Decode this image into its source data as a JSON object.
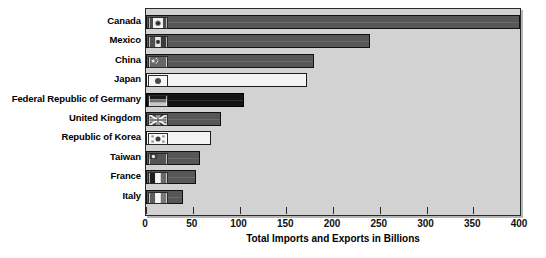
{
  "chart_data": {
    "type": "bar",
    "orientation": "horizontal",
    "title": "",
    "xlabel": "Total Imports and Exports in Billions",
    "ylabel": "",
    "xlim": [
      0,
      400
    ],
    "xticks": [
      0,
      50,
      100,
      150,
      200,
      250,
      300,
      350,
      400
    ],
    "grid": false,
    "legend": "none",
    "categories": [
      "Canada",
      "Mexico",
      "China",
      "Japan",
      "Federal Republic of Germany",
      "United Kingdom",
      "Republic of Korea",
      "Taiwan",
      "France",
      "Italy"
    ],
    "values": [
      400,
      240,
      180,
      172,
      105,
      80,
      70,
      58,
      53,
      40
    ],
    "bars": [
      {
        "label": "Canada",
        "value": 400,
        "style": "dark-gray",
        "flag": "flag-canada-icon"
      },
      {
        "label": "Mexico",
        "value": 240,
        "style": "dark-gray",
        "flag": "flag-mexico-icon"
      },
      {
        "label": "China",
        "value": 180,
        "style": "dark-gray",
        "flag": "flag-china-icon"
      },
      {
        "label": "Japan",
        "value": 172,
        "style": "light",
        "flag": "flag-japan-icon"
      },
      {
        "label": "Federal Republic of Germany",
        "value": 105,
        "style": "black",
        "flag": "flag-germany-icon"
      },
      {
        "label": "United Kingdom",
        "value": 80,
        "style": "dark-gray",
        "flag": "flag-united-kingdom-icon"
      },
      {
        "label": "Republic of Korea",
        "value": 70,
        "style": "light",
        "flag": "flag-south-korea-icon"
      },
      {
        "label": "Taiwan",
        "value": 58,
        "style": "dark-gray",
        "flag": "flag-taiwan-icon"
      },
      {
        "label": "France",
        "value": 53,
        "style": "dark-gray",
        "flag": "flag-france-icon"
      },
      {
        "label": "Italy",
        "value": 40,
        "style": "dark-gray",
        "flag": "flag-italy-icon"
      }
    ],
    "colors": {
      "plot_background": "#d2d2d2",
      "bar_dark_gray": "#575757",
      "bar_black": "#141414",
      "bar_light": "#f3f3f3",
      "axis": "#2a2a2a",
      "page_background": "#ffffff",
      "text": "#000000"
    }
  }
}
